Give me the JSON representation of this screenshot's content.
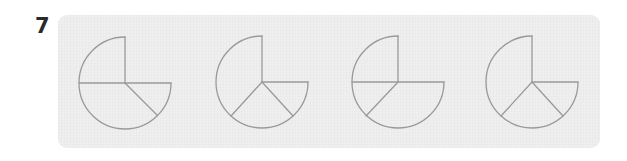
{
  "question": {
    "number": "7"
  },
  "panel": {
    "background": "#efefef",
    "stroke_color": "#9a9a9a"
  },
  "figures": [
    {
      "id": "figure-1",
      "shape": "circle missing upper-right quadrant",
      "center": [
        125,
        83
      ],
      "radius": 46,
      "segments": [
        "vertical radius up",
        "full horizontal diameter",
        "radius lower-right 45deg"
      ]
    },
    {
      "id": "figure-2",
      "shape": "circle missing upper-right quadrant",
      "center": [
        262,
        82
      ],
      "radius": 46,
      "segments": [
        "vertical radius up",
        "horizontal radius right",
        "radius lower-left",
        "radius lower-right"
      ]
    },
    {
      "id": "figure-3",
      "shape": "circle missing upper-right quadrant",
      "center": [
        398,
        82
      ],
      "radius": 46,
      "segments": [
        "vertical radius up",
        "full horizontal diameter",
        "radius lower-left"
      ]
    },
    {
      "id": "figure-4",
      "shape": "circle missing upper-right quadrant",
      "center": [
        532,
        82
      ],
      "radius": 46,
      "segments": [
        "vertical radius up",
        "horizontal radius right",
        "radius lower-left",
        "radius lower-right"
      ]
    }
  ]
}
